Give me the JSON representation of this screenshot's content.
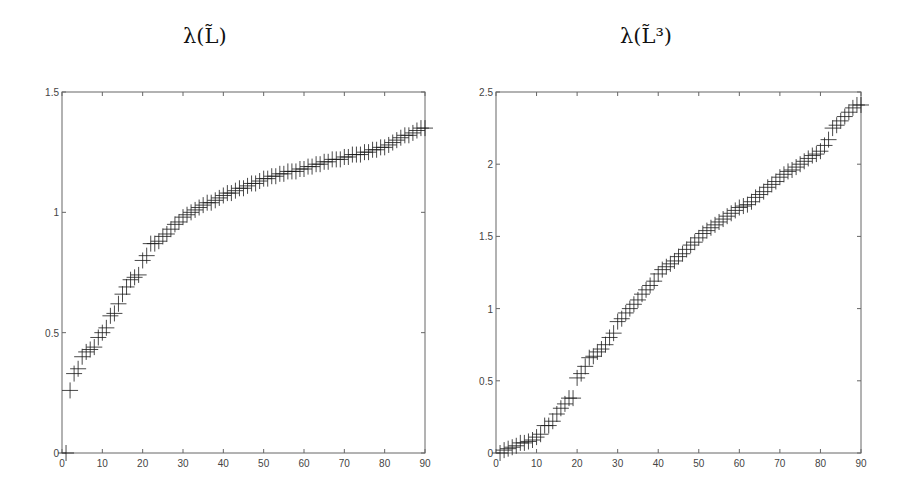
{
  "chart_data": [
    {
      "type": "scatter",
      "marker": "+",
      "title": "λ(L̃)",
      "xlabel": "",
      "ylabel": "",
      "xlim": [
        0,
        90
      ],
      "ylim": [
        0,
        1.5
      ],
      "xticks": [
        "0",
        "10",
        "20",
        "30",
        "40",
        "50",
        "60",
        "70",
        "80",
        "90"
      ],
      "yticks": [
        "0",
        "0.5",
        "1",
        "1.5"
      ],
      "grid": false,
      "x": [
        1,
        2,
        3,
        4,
        5,
        6,
        7,
        8,
        9,
        10,
        11,
        12,
        13,
        14,
        15,
        16,
        17,
        18,
        19,
        20,
        21,
        22,
        23,
        24,
        25,
        26,
        27,
        28,
        29,
        30,
        31,
        32,
        33,
        34,
        35,
        36,
        37,
        38,
        39,
        40,
        41,
        42,
        43,
        44,
        45,
        46,
        47,
        48,
        49,
        50,
        51,
        52,
        53,
        54,
        55,
        56,
        57,
        58,
        59,
        60,
        61,
        62,
        63,
        64,
        65,
        66,
        67,
        68,
        69,
        70,
        71,
        72,
        73,
        74,
        75,
        76,
        77,
        78,
        79,
        80,
        81,
        82,
        83,
        84,
        85,
        86,
        87,
        88,
        89,
        90
      ],
      "values": [
        0.0,
        0.26,
        0.33,
        0.35,
        0.4,
        0.42,
        0.43,
        0.44,
        0.48,
        0.5,
        0.52,
        0.57,
        0.58,
        0.62,
        0.66,
        0.69,
        0.72,
        0.73,
        0.74,
        0.8,
        0.82,
        0.87,
        0.87,
        0.88,
        0.9,
        0.91,
        0.93,
        0.95,
        0.96,
        0.98,
        0.99,
        1.0,
        1.01,
        1.02,
        1.03,
        1.04,
        1.04,
        1.05,
        1.06,
        1.07,
        1.08,
        1.08,
        1.09,
        1.1,
        1.1,
        1.11,
        1.12,
        1.12,
        1.13,
        1.14,
        1.14,
        1.15,
        1.15,
        1.16,
        1.16,
        1.17,
        1.17,
        1.17,
        1.18,
        1.18,
        1.19,
        1.19,
        1.2,
        1.2,
        1.21,
        1.21,
        1.22,
        1.22,
        1.22,
        1.23,
        1.23,
        1.24,
        1.24,
        1.24,
        1.25,
        1.25,
        1.26,
        1.26,
        1.27,
        1.27,
        1.28,
        1.29,
        1.3,
        1.31,
        1.32,
        1.32,
        1.33,
        1.34,
        1.35,
        1.35
      ]
    },
    {
      "type": "scatter",
      "marker": "+",
      "title": "λ(L̃³)",
      "xlabel": "",
      "ylabel": "",
      "xlim": [
        0,
        90
      ],
      "ylim": [
        0,
        2.5
      ],
      "xticks": [
        "0",
        "10",
        "20",
        "30",
        "40",
        "50",
        "60",
        "70",
        "80",
        "90"
      ],
      "yticks": [
        "0",
        "0.5",
        "1",
        "1.5",
        "2",
        "2.5"
      ],
      "grid": false,
      "x": [
        1,
        2,
        3,
        4,
        5,
        6,
        7,
        8,
        9,
        10,
        11,
        12,
        13,
        14,
        15,
        16,
        17,
        18,
        19,
        20,
        21,
        22,
        23,
        24,
        25,
        26,
        27,
        28,
        29,
        30,
        31,
        32,
        33,
        34,
        35,
        36,
        37,
        38,
        39,
        40,
        41,
        42,
        43,
        44,
        45,
        46,
        47,
        48,
        49,
        50,
        51,
        52,
        53,
        54,
        55,
        56,
        57,
        58,
        59,
        60,
        61,
        62,
        63,
        64,
        65,
        66,
        67,
        68,
        69,
        70,
        71,
        72,
        73,
        74,
        75,
        76,
        77,
        78,
        79,
        80,
        81,
        82,
        83,
        84,
        85,
        86,
        87,
        88,
        89,
        90
      ],
      "values": [
        0.0,
        0.02,
        0.03,
        0.04,
        0.05,
        0.07,
        0.07,
        0.08,
        0.09,
        0.11,
        0.13,
        0.19,
        0.19,
        0.22,
        0.27,
        0.31,
        0.34,
        0.38,
        0.38,
        0.52,
        0.55,
        0.6,
        0.66,
        0.67,
        0.7,
        0.72,
        0.75,
        0.8,
        0.83,
        0.91,
        0.93,
        0.97,
        1.0,
        1.03,
        1.06,
        1.1,
        1.13,
        1.16,
        1.19,
        1.24,
        1.27,
        1.29,
        1.31,
        1.33,
        1.36,
        1.38,
        1.41,
        1.44,
        1.46,
        1.49,
        1.52,
        1.54,
        1.56,
        1.58,
        1.6,
        1.62,
        1.64,
        1.66,
        1.68,
        1.7,
        1.71,
        1.72,
        1.74,
        1.77,
        1.79,
        1.81,
        1.84,
        1.86,
        1.88,
        1.91,
        1.93,
        1.95,
        1.96,
        1.98,
        2.0,
        2.02,
        2.04,
        2.06,
        2.07,
        2.09,
        2.13,
        2.17,
        2.25,
        2.27,
        2.3,
        2.33,
        2.36,
        2.39,
        2.41,
        2.41
      ]
    }
  ],
  "style": {
    "marker_color": "#1a1a1a",
    "axis_color": "#666666",
    "label_color": "#444444"
  }
}
